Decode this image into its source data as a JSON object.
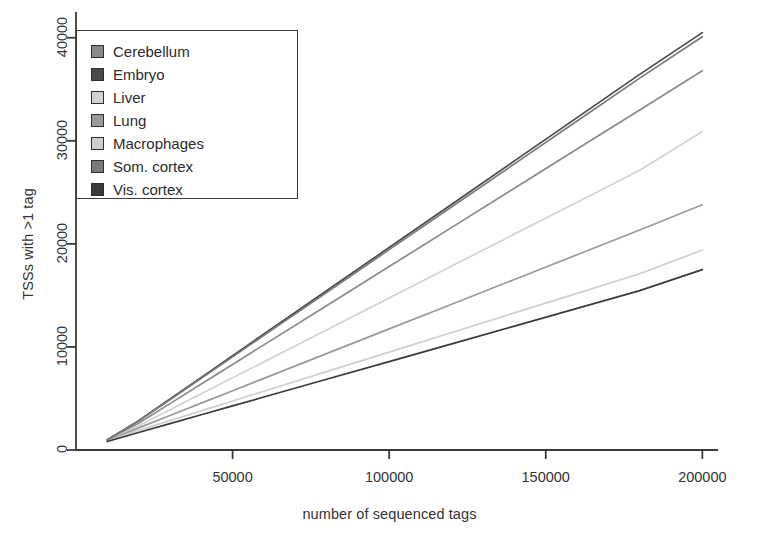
{
  "chart_data": {
    "type": "line",
    "title": "",
    "xlabel": "number of sequenced tags",
    "ylabel": "TSSs with >1 tag",
    "xlim": [
      0,
      205000
    ],
    "ylim": [
      0,
      42500
    ],
    "xticks": [
      50000,
      100000,
      150000,
      200000
    ],
    "xtick_labels": [
      "50000",
      "100000",
      "150000",
      "200000"
    ],
    "yticks": [
      0,
      10000,
      20000,
      30000,
      40000
    ],
    "ytick_labels": [
      "0",
      "10000",
      "20000",
      "30000",
      "40000"
    ],
    "grid": false,
    "legend_position": "top-left",
    "x": [
      10000,
      20000,
      30000,
      40000,
      50000,
      60000,
      80000,
      100000,
      120000,
      140000,
      160000,
      180000,
      200000
    ],
    "series": [
      {
        "name": "Cerebellum",
        "color": "#8a8a8a",
        "values": [
          950,
          2600,
          4500,
          6400,
          8300,
          10200,
          14000,
          17800,
          21600,
          25400,
          29200,
          33000,
          36800
        ]
      },
      {
        "name": "Embryo",
        "color": "#4a4a4a",
        "values": [
          1000,
          2850,
          4950,
          7050,
          9150,
          11250,
          15450,
          19650,
          23850,
          28050,
          32250,
          36450,
          40500
        ]
      },
      {
        "name": "Liver",
        "color": "#d2d2d2",
        "values": [
          900,
          2350,
          3900,
          5450,
          7000,
          8550,
          11650,
          14750,
          17850,
          20950,
          24050,
          27150,
          30900
        ]
      },
      {
        "name": "Lung",
        "color": "#9a9a9a",
        "values": [
          900,
          2150,
          3350,
          4550,
          5750,
          6950,
          9350,
          11750,
          14150,
          16550,
          18950,
          21350,
          23800
        ]
      },
      {
        "name": "Macrophages",
        "color": "#cfcfcf",
        "values": [
          850,
          1900,
          2850,
          3800,
          4750,
          5700,
          7600,
          9500,
          11400,
          13300,
          15200,
          17100,
          19400
        ]
      },
      {
        "name": "Som. cortex",
        "color": "#7a7a7a",
        "values": [
          980,
          2800,
          4880,
          6960,
          9040,
          11120,
          15280,
          19440,
          23600,
          27760,
          31920,
          36080,
          40100
        ]
      },
      {
        "name": "Vis. cortex",
        "color": "#3a3a3a",
        "values": [
          820,
          1700,
          2560,
          3420,
          4280,
          5140,
          6860,
          8580,
          10300,
          12020,
          13740,
          15460,
          17500
        ]
      }
    ]
  },
  "legend": {
    "items": [
      {
        "label": "Cerebellum"
      },
      {
        "label": "Embryo"
      },
      {
        "label": "Liver"
      },
      {
        "label": "Lung"
      },
      {
        "label": "Macrophages"
      },
      {
        "label": "Som. cortex"
      },
      {
        "label": "Vis. cortex"
      }
    ]
  }
}
